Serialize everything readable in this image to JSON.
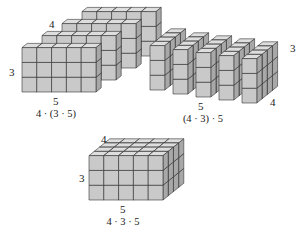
{
  "figure": {
    "colors": {
      "front": "#c9c9c9",
      "top": "#dedede",
      "side": "#a8a8a8",
      "edge": "#333333"
    }
  },
  "arrangement_left": {
    "dims": {
      "width": 5,
      "height": 3,
      "layers": 4
    },
    "labels": {
      "layers": "4",
      "height": "3",
      "width": "5"
    },
    "expression": "4 · (3 · 5)"
  },
  "arrangement_right": {
    "dims": {
      "columns": 5,
      "height": 3,
      "depth": 4
    },
    "labels": {
      "height": "3",
      "depth": "4",
      "columns": "5"
    },
    "expression": "(4 · 3) · 5"
  },
  "arrangement_bottom": {
    "dims": {
      "width": 5,
      "height": 3,
      "depth": 4
    },
    "labels": {
      "depth": "4",
      "height": "3",
      "width": "5"
    },
    "expression": "4 · 3 · 5"
  }
}
